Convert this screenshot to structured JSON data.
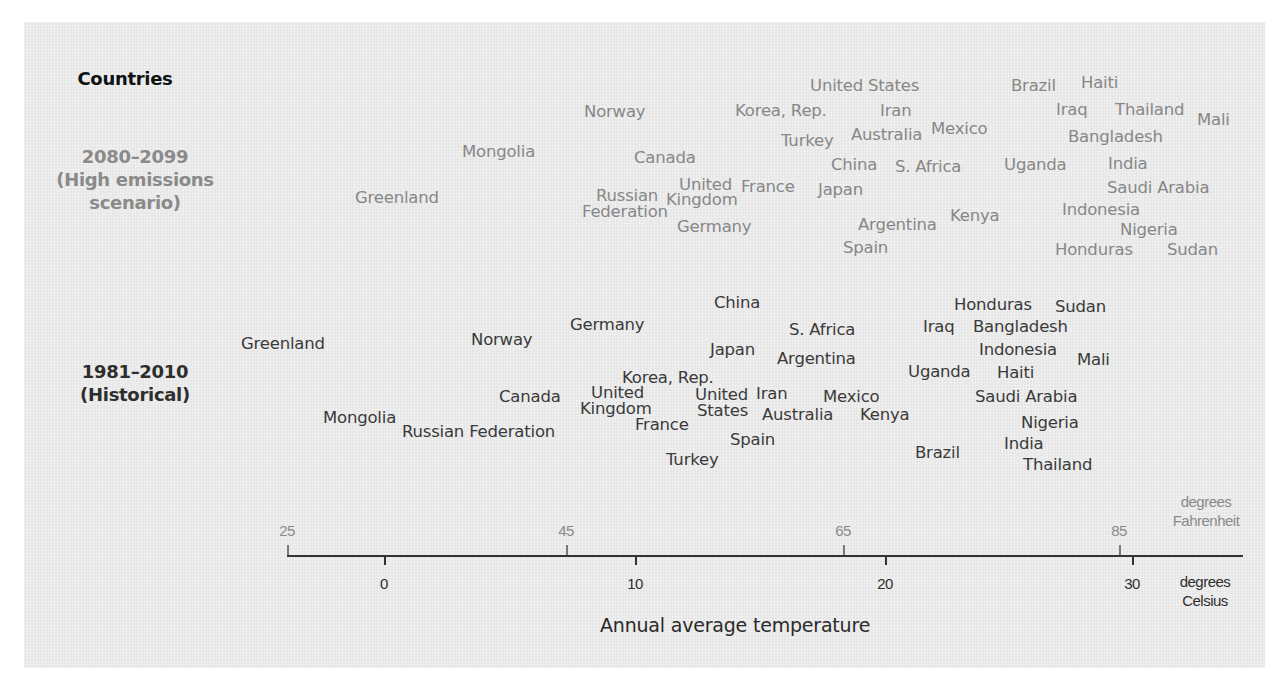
{
  "chart_data": {
    "type": "scatter",
    "title": "Countries",
    "xlabel": "Annual average temperature",
    "x_units": {
      "primary": "degrees Celsius",
      "secondary": "degrees Fahrenheit"
    },
    "xlim_celsius": [
      -4,
      34
    ],
    "celsius_ticks": [
      0,
      10,
      20,
      30
    ],
    "fahrenheit_ticks": [
      25,
      45,
      65,
      85
    ],
    "grid": false,
    "legend": "none",
    "rows": [
      {
        "label": "2080–2099 (High emissions scenario)"
      },
      {
        "label": "1981–2010 (Historical)"
      }
    ],
    "series": [
      {
        "name": "2080–2099 (High emissions scenario)",
        "points_celsius_approx": {
          "Greenland": 1.5,
          "Mongolia": 5.5,
          "Norway": 9,
          "Canada": 11,
          "Russian Federation": 9.5,
          "United Kingdom": 13,
          "France": 15,
          "Germany": 13,
          "Korea, Rep.": 16,
          "United States": 18,
          "Turkey": 17,
          "Japan": 18,
          "China": 18.5,
          "Iran": 20,
          "Australia": 20,
          "Mexico": 22.5,
          "S. Africa": 21,
          "Argentina": 20,
          "Spain": 19,
          "Kenya": 23,
          "Uganda": 26,
          "Brazil": 26.5,
          "Haiti": 28.5,
          "Iraq": 27.5,
          "Thailand": 29.5,
          "Mali": 32,
          "Bangladesh": 29,
          "India": 29,
          "Saudi Arabia": 30.5,
          "Indonesia": 28.5,
          "Nigeria": 30,
          "Honduras": 28.5,
          "Sudan": 32
        }
      },
      {
        "name": "1981–2010 (Historical)",
        "points_celsius_approx": {
          "Greenland": -2.5,
          "Mongolia": 0,
          "Russian Federation": 4.5,
          "Norway": 5,
          "Canada": 6.5,
          "United Kingdom": 9,
          "Germany": 9,
          "France": 11,
          "Korea, Rep.": 11.5,
          "United States": 12.5,
          "Turkey": 12.5,
          "Japan": 14,
          "Spain": 14.5,
          "China": 14.5,
          "Iran": 15,
          "Australia": 17,
          "S. Africa": 17.5,
          "Argentina": 17.5,
          "Mexico": 18.5,
          "Kenya": 20.5,
          "Brazil": 22,
          "Uganda": 22.5,
          "Iraq": 22.5,
          "Honduras": 24.5,
          "Bangladesh": 25.5,
          "Indonesia": 25.5,
          "Haiti": 25.5,
          "Saudi Arabia": 25.5,
          "Nigeria": 26.5,
          "India": 25.5,
          "Thailand": 27,
          "Sudan": 28.5,
          "Mali": 28.5
        }
      }
    ]
  },
  "labels": {
    "title": "Countries",
    "projected_line1": "2080–2099",
    "projected_line2": "(High emissions",
    "projected_line3": "scenario)",
    "historical_line1": "1981–2010",
    "historical_line2": "(Historical)"
  },
  "projected": [
    {
      "name": "United States",
      "x": 810,
      "y": 78
    },
    {
      "name": "Brazil",
      "x": 1011,
      "y": 78
    },
    {
      "name": "Haiti",
      "x": 1081,
      "y": 75
    },
    {
      "name": "Norway",
      "x": 584,
      "y": 104
    },
    {
      "name": "Korea, Rep.",
      "x": 735,
      "y": 103
    },
    {
      "name": "Iran",
      "x": 880,
      "y": 103
    },
    {
      "name": "Iraq",
      "x": 1056,
      "y": 102
    },
    {
      "name": "Thailand",
      "x": 1115,
      "y": 102
    },
    {
      "name": "Mali",
      "x": 1197,
      "y": 112
    },
    {
      "name": "Turkey",
      "x": 781,
      "y": 133
    },
    {
      "name": "Australia",
      "x": 851,
      "y": 127
    },
    {
      "name": "Mexico",
      "x": 931,
      "y": 121
    },
    {
      "name": "Bangladesh",
      "x": 1068,
      "y": 129
    },
    {
      "name": "Mongolia",
      "x": 462,
      "y": 144
    },
    {
      "name": "Canada",
      "x": 634,
      "y": 150
    },
    {
      "name": "China",
      "x": 831,
      "y": 157
    },
    {
      "name": "S. Africa",
      "x": 895,
      "y": 159
    },
    {
      "name": "Uganda",
      "x": 1004,
      "y": 157
    },
    {
      "name": "India",
      "x": 1108,
      "y": 156
    },
    {
      "name": "United",
      "x": 679,
      "y": 177
    },
    {
      "name": "Kingdom",
      "x": 666,
      "y": 192
    },
    {
      "name": "France",
      "x": 741,
      "y": 179
    },
    {
      "name": "Japan",
      "x": 818,
      "y": 182
    },
    {
      "name": "Russian",
      "x": 596,
      "y": 188
    },
    {
      "name": "Federation",
      "x": 582,
      "y": 204
    },
    {
      "name": "Greenland",
      "x": 355,
      "y": 190
    },
    {
      "name": "Saudi Arabia",
      "x": 1107,
      "y": 180
    },
    {
      "name": "Indonesia",
      "x": 1062,
      "y": 202
    },
    {
      "name": "Kenya",
      "x": 950,
      "y": 208
    },
    {
      "name": "Argentina",
      "x": 858,
      "y": 217
    },
    {
      "name": "Germany",
      "x": 677,
      "y": 219
    },
    {
      "name": "Nigeria",
      "x": 1120,
      "y": 222
    },
    {
      "name": "Spain",
      "x": 843,
      "y": 240
    },
    {
      "name": "Honduras",
      "x": 1055,
      "y": 242
    },
    {
      "name": "Sudan",
      "x": 1167,
      "y": 242
    }
  ],
  "historical": [
    {
      "name": "China",
      "x": 714,
      "y": 295
    },
    {
      "name": "Honduras",
      "x": 954,
      "y": 297
    },
    {
      "name": "Sudan",
      "x": 1055,
      "y": 299
    },
    {
      "name": "Germany",
      "x": 570,
      "y": 317
    },
    {
      "name": "Iraq",
      "x": 923,
      "y": 319
    },
    {
      "name": "Bangladesh",
      "x": 973,
      "y": 319
    },
    {
      "name": "S. Africa",
      "x": 789,
      "y": 322
    },
    {
      "name": "Norway",
      "x": 471,
      "y": 332
    },
    {
      "name": "Greenland",
      "x": 241,
      "y": 336
    },
    {
      "name": "Japan",
      "x": 710,
      "y": 342
    },
    {
      "name": "Argentina",
      "x": 777,
      "y": 351
    },
    {
      "name": "Indonesia",
      "x": 979,
      "y": 342
    },
    {
      "name": "Mali",
      "x": 1077,
      "y": 352
    },
    {
      "name": "Uganda",
      "x": 908,
      "y": 364
    },
    {
      "name": "Haiti",
      "x": 997,
      "y": 365
    },
    {
      "name": "Korea, Rep.",
      "x": 622,
      "y": 370
    },
    {
      "name": "Canada",
      "x": 499,
      "y": 389
    },
    {
      "name": "United",
      "x": 591,
      "y": 385
    },
    {
      "name": "Kingdom",
      "x": 580,
      "y": 401
    },
    {
      "name": "United",
      "x": 695,
      "y": 387
    },
    {
      "name": "States",
      "x": 697,
      "y": 403
    },
    {
      "name": "Iran",
      "x": 756,
      "y": 386
    },
    {
      "name": "Mexico",
      "x": 823,
      "y": 389
    },
    {
      "name": "Saudi Arabia",
      "x": 975,
      "y": 389
    },
    {
      "name": "Mongolia",
      "x": 323,
      "y": 410
    },
    {
      "name": "Russian Federation",
      "x": 402,
      "y": 424
    },
    {
      "name": "Australia",
      "x": 762,
      "y": 407
    },
    {
      "name": "Kenya",
      "x": 860,
      "y": 407
    },
    {
      "name": "France",
      "x": 635,
      "y": 417
    },
    {
      "name": "Nigeria",
      "x": 1021,
      "y": 415
    },
    {
      "name": "Spain",
      "x": 730,
      "y": 432
    },
    {
      "name": "India",
      "x": 1004,
      "y": 436
    },
    {
      "name": "Brazil",
      "x": 915,
      "y": 445
    },
    {
      "name": "Turkey",
      "x": 666,
      "y": 452
    },
    {
      "name": "Thailand",
      "x": 1023,
      "y": 457
    }
  ],
  "axis": {
    "title": "Annual average temperature",
    "fahrenheit_unit_line1": "degrees",
    "fahrenheit_unit_line2": "Fahrenheit",
    "celsius_unit_line1": "degrees",
    "celsius_unit_line2": "Celsius",
    "fahrenheit_ticks": [
      {
        "label": "25",
        "x": 287
      },
      {
        "label": "45",
        "x": 566
      },
      {
        "label": "65",
        "x": 843
      },
      {
        "label": "85",
        "x": 1119
      }
    ],
    "celsius_ticks": [
      {
        "label": "0",
        "x": 384
      },
      {
        "label": "10",
        "x": 635
      },
      {
        "label": "20",
        "x": 885
      },
      {
        "label": "30",
        "x": 1132
      }
    ]
  }
}
